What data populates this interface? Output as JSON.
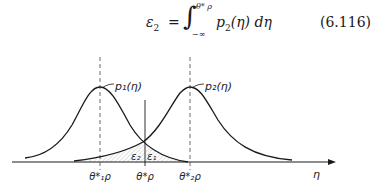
{
  "equation": {
    "lhs_symbol": "ε",
    "lhs_sub": "2",
    "equals": "=",
    "integral": "∫",
    "upper_limit": "θ* ρ",
    "lower_limit": "−∞",
    "integrand": "p",
    "integrand_sub": "2",
    "integrand_arg": "(η) dη",
    "number": "(6.116)"
  },
  "figure": {
    "curve1_label": "p₁(η)",
    "curve2_label": "p₂(η)",
    "region_label_left": "ε₂",
    "region_label_right": "ε₁",
    "x_axis_label": "η",
    "ticks": [
      {
        "label": "θ*₁ρ",
        "position": "peak of p1"
      },
      {
        "label": "θ*ρ",
        "position": "decision threshold"
      },
      {
        "label": "θ*₂ρ",
        "position": "peak of p2"
      }
    ],
    "line_color": "#1a1a1a"
  }
}
